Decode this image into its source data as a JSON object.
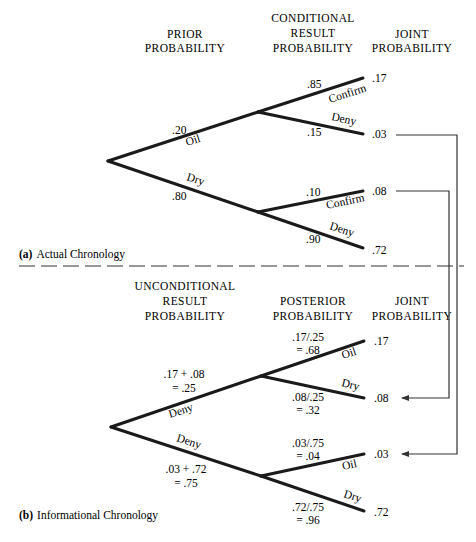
{
  "part_a": {
    "caption_letter": "(a)",
    "caption_text": "Actual Chronology",
    "headers": {
      "prior": [
        "PRIOR",
        "PROBABILITY"
      ],
      "conditional": [
        "CONDITIONAL",
        "RESULT",
        "PROBABILITY"
      ],
      "joint": [
        "JOINT",
        "PROBABILITY"
      ]
    },
    "first_branches": [
      {
        "label": "Oil",
        "prob": ".20"
      },
      {
        "label": "Dry",
        "prob": ".80"
      }
    ],
    "second_branches": [
      {
        "parent": "Oil",
        "label": "Confirm",
        "prob": ".85",
        "joint": ".17"
      },
      {
        "parent": "Oil",
        "label": "Deny",
        "prob": ".15",
        "joint": ".03"
      },
      {
        "parent": "Dry",
        "label": "Confirm",
        "prob": ".10",
        "joint": ".08"
      },
      {
        "parent": "Dry",
        "label": "Deny",
        "prob": ".90",
        "joint": ".72"
      }
    ]
  },
  "part_b": {
    "caption_letter": "(b)",
    "caption_text": "Informational Chronology",
    "headers": {
      "unconditional": [
        "UNCONDITIONAL",
        "RESULT",
        "PROBABILITY"
      ],
      "posterior": [
        "POSTERIOR",
        "PROBABILITY"
      ],
      "joint": [
        "JOINT",
        "PROBABILITY"
      ]
    },
    "first_branches": [
      {
        "label": "Confirm",
        "calc": ".17 + .08",
        "result": "= .25"
      },
      {
        "label": "Deny",
        "calc": ".03 + .72",
        "result": "= .75"
      }
    ],
    "second_branches": [
      {
        "parent": "Confirm",
        "label": "Oil",
        "calc": ".17/.25",
        "result": "= .68",
        "joint": ".17"
      },
      {
        "parent": "Confirm",
        "label": "Dry",
        "calc": ".08/.25",
        "result": "= .32",
        "joint": ".08"
      },
      {
        "parent": "Deny",
        "label": "Oil",
        "calc": ".03/.75",
        "result": "= .04",
        "joint": ".03"
      },
      {
        "parent": "Deny",
        "label": "Dry",
        "calc": ".72/.75",
        "result": "= .96",
        "joint": ".72"
      }
    ]
  }
}
